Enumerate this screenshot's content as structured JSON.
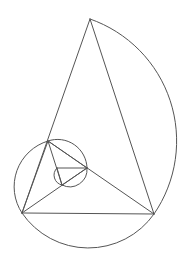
{
  "diagram": {
    "style": {
      "stroke_color": "#555555",
      "background": "#ffffff",
      "line_width": 1
    },
    "note": "Vertex coordinates are estimated from the screenshot. Internal ids (p1..p7) are for the template only and do not appear in the image.",
    "points": {
      "p1": [
        90,
        19
      ],
      "p2": [
        22,
        213
      ],
      "p3": [
        154,
        214
      ],
      "p4": [
        48,
        141
      ],
      "p5": [
        87,
        168
      ],
      "p6": [
        62,
        185
      ],
      "p7": [
        57,
        168
      ]
    },
    "segments": [
      [
        "p1",
        "p2"
      ],
      [
        "p1",
        "p3"
      ],
      [
        "p2",
        "p3"
      ],
      [
        "p4",
        "p3"
      ],
      [
        "p4",
        "p2"
      ],
      [
        "p5",
        "p2"
      ],
      [
        "p4",
        "p5"
      ],
      [
        "p6",
        "p4"
      ],
      [
        "p5",
        "p6"
      ],
      [
        "p7",
        "p5"
      ],
      [
        "p6",
        "p7"
      ]
    ],
    "arcs": [
      {
        "from": "p1",
        "to": "p3",
        "center": "p4"
      },
      {
        "from": "p3",
        "to": "p2",
        "center": "p5"
      },
      {
        "from": "p2",
        "to": "p4",
        "center": "p6"
      },
      {
        "from": "p4",
        "to": "p5",
        "center": "p7"
      },
      {
        "from": "p5",
        "to": "p6",
        "center_xy": [
          69,
          170
        ]
      },
      {
        "from": "p6",
        "to": "p7",
        "center_xy": [
          63,
          172
        ]
      }
    ]
  }
}
